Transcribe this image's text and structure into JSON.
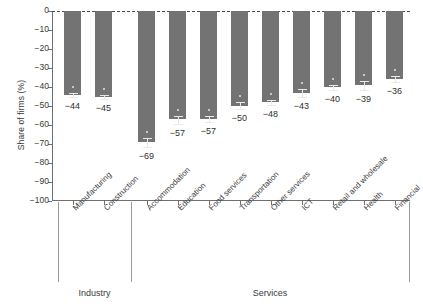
{
  "chart_data": {
    "type": "bar",
    "title": "",
    "subtitle": "",
    "xlabel": "",
    "ylabel": "Share of firms (%)",
    "ylim": [
      -100,
      0
    ],
    "ytick_labels": [
      "0",
      "−10",
      "−20",
      "−30",
      "−40",
      "−50",
      "−60",
      "−70",
      "−80",
      "−90",
      "−100"
    ],
    "ytick_values": [
      0,
      -10,
      -20,
      -30,
      -40,
      -50,
      -60,
      -70,
      -80,
      -90,
      -100
    ],
    "grid": false,
    "legend": "none",
    "zero_reference_line": "dashed",
    "bar_color": "#737373",
    "error_bar_color": "#e9e9e9",
    "categories": [
      "Manufacturing",
      "Construction",
      "Accommodation",
      "Education",
      "Food services",
      "Transportation",
      "Other services",
      "ICT",
      "Retail and wholesale",
      "Health",
      "Financial"
    ],
    "values": [
      -44,
      -45,
      -69,
      -57,
      -57,
      -50,
      -48,
      -43,
      -40,
      -39,
      -36
    ],
    "value_labels": [
      "−44",
      "−45",
      "−69",
      "−57",
      "−57",
      "−50",
      "−48",
      "−43",
      "−40",
      "−39",
      "−36"
    ],
    "error_low": [
      -46,
      -47,
      -72,
      -60,
      -59,
      -52,
      -50,
      -46,
      -42,
      -42,
      -38
    ],
    "error_high": [
      -43,
      -44,
      -67,
      -55,
      -55,
      -48,
      -47,
      -41,
      -39,
      -37,
      -34
    ],
    "groups": [
      {
        "label": "Industry",
        "categories": [
          "Manufacturing",
          "Construction"
        ]
      },
      {
        "label": "Services",
        "categories": [
          "Accommodation",
          "Education",
          "Food services",
          "Transportation",
          "Other services",
          "ICT",
          "Retail and wholesale",
          "Health",
          "Financial"
        ]
      }
    ]
  }
}
